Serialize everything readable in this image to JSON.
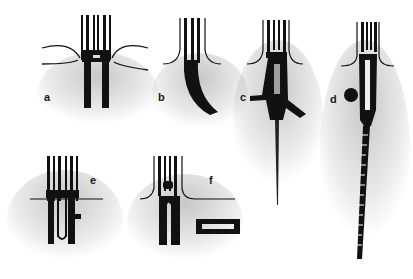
{
  "figure": {
    "panels": [
      {
        "id": "a",
        "label": "a"
      },
      {
        "id": "b",
        "label": "b"
      },
      {
        "id": "c",
        "label": "c"
      },
      {
        "id": "d",
        "label": "d"
      },
      {
        "id": "e",
        "label": "e"
      },
      {
        "id": "f",
        "label": "f"
      }
    ],
    "colors": {
      "ink": "#111111",
      "stipple": "#9a9a9a",
      "background": "#ffffff"
    }
  }
}
